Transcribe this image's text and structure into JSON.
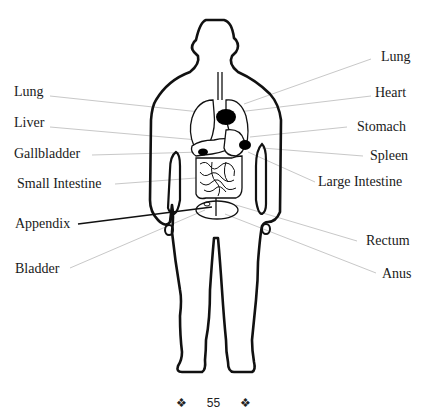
{
  "diagram": {
    "labels_left": [
      {
        "id": "lung-left",
        "text": "Lung"
      },
      {
        "id": "liver",
        "text": "Liver"
      },
      {
        "id": "gallbladder",
        "text": "Gallbladder"
      },
      {
        "id": "small-intestine",
        "text": "Small Intestine"
      },
      {
        "id": "appendix",
        "text": "Appendix"
      },
      {
        "id": "bladder",
        "text": "Bladder"
      }
    ],
    "labels_right": [
      {
        "id": "lung-right",
        "text": "Lung"
      },
      {
        "id": "heart",
        "text": "Heart"
      },
      {
        "id": "stomach",
        "text": "Stomach"
      },
      {
        "id": "spleen",
        "text": "Spleen"
      },
      {
        "id": "large-intestine",
        "text": "Large Intestine"
      },
      {
        "id": "rectum",
        "text": "Rectum"
      },
      {
        "id": "anus",
        "text": "Anus"
      }
    ]
  },
  "footer": {
    "ornament_left": "❖",
    "page_number": "55",
    "ornament_right": "❖"
  }
}
